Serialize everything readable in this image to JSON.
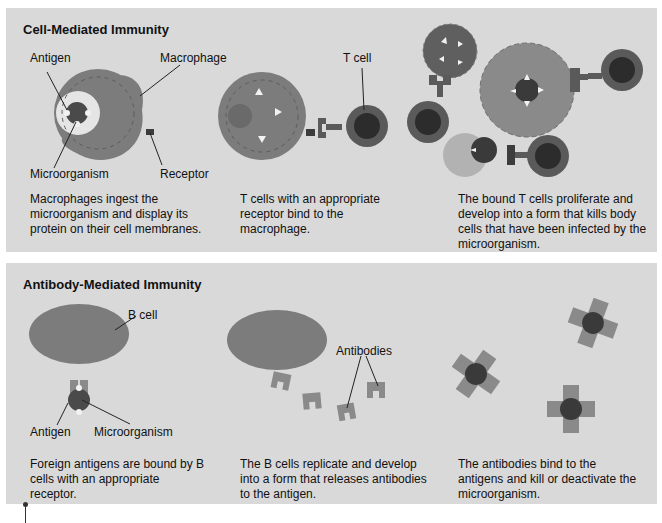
{
  "panels": [
    {
      "title": "Cell-Mediated Immunity",
      "labels": {
        "antigen": "Antigen",
        "macrophage": "Macrophage",
        "microorganism": "Microorganism",
        "receptor": "Receptor",
        "t_cell": "T cell"
      },
      "captions": [
        "Macrophages ingest the microorganism and display its protein on their cell membranes.",
        "T cells with an appropriate receptor bind to the macrophage.",
        "The bound T cells proliferate and develop into a form that kills body cells that have been infected by the microorganism."
      ]
    },
    {
      "title": "Antibody-Mediated Immunity",
      "labels": {
        "b_cell": "B cell",
        "antigen": "Antigen",
        "microorganism": "Microorganism",
        "antibodies": "Antibodies"
      },
      "captions": [
        "Foreign antigens are bound by B cells with an appropriate receptor.",
        "The B cells replicate and develop into a form that releases antibodies to the antigen.",
        "The antibodies bind to the antigens and kill or deactivate the microorganism."
      ]
    }
  ],
  "colors": {
    "panel_bg": "#d9d9d9",
    "cell_mid": "#7c7c7c",
    "cell_dark": "#3c3c3c",
    "antibody": "#8a8a8a",
    "antigen": "#f2f2f2"
  }
}
